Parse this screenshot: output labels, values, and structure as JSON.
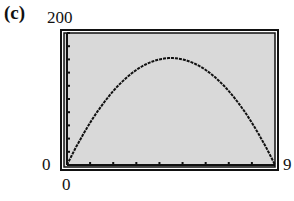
{
  "panel": {
    "label": "(c)"
  },
  "window": {
    "ymax_label": "200",
    "ymin_label": "0",
    "xmin_label": "0",
    "xmax_label": "9",
    "background": "#d9d9d9",
    "frame_color": "#111111"
  },
  "chart_data": {
    "type": "line",
    "title": "",
    "xlabel": "",
    "ylabel": "",
    "xlim": [
      0,
      9
    ],
    "ylim": [
      0,
      200
    ],
    "x_tick_step": 1,
    "y_tick_step": 20,
    "grid": false,
    "legend": null,
    "series": [
      {
        "name": "curve",
        "x": [
          0,
          1,
          2,
          3,
          4,
          4.5,
          5,
          6,
          7,
          8,
          9
        ],
        "values": [
          0,
          64,
          112,
          144,
          160,
          162,
          160,
          144,
          112,
          64,
          0
        ]
      }
    ],
    "annotations": [
      "(c)"
    ]
  }
}
